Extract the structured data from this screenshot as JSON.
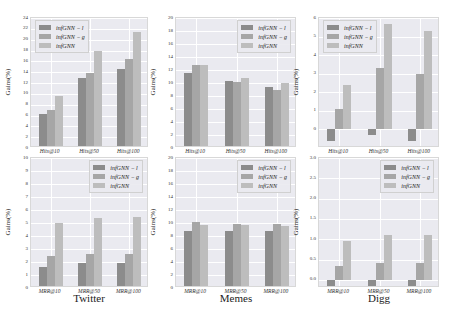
{
  "colors": {
    "infGNN-l": "#8c8c8c",
    "infGNN-g": "#a6a6a6",
    "infGNN": "#bdbdbd",
    "plot_bg": "#eaeaf0",
    "grid": "#ffffff"
  },
  "legend": [
    "infGNN − l",
    "infGNN − g",
    "infGNN"
  ],
  "datasets": [
    "Twitter",
    "Memes",
    "Digg"
  ],
  "chart_data": [
    {
      "type": "bar",
      "dataset": "Twitter",
      "metric": "Hits",
      "categories": [
        "Hits@10",
        "Hits@50",
        "Hits@100"
      ],
      "series": [
        {
          "name": "infGNN − l",
          "values": [
            6.2,
            12.9,
            14.5
          ]
        },
        {
          "name": "infGNN − g",
          "values": [
            7.0,
            13.8,
            16.5
          ]
        },
        {
          "name": "infGNN",
          "values": [
            9.6,
            17.9,
            21.4
          ]
        }
      ],
      "ylabel": "Gains(%)",
      "ylim": [
        0,
        24
      ],
      "yticks": [
        0,
        2,
        4,
        6,
        8,
        10,
        12,
        14,
        16,
        18,
        20,
        22,
        24
      ],
      "legend_position": "upper left",
      "grid": true
    },
    {
      "type": "bar",
      "dataset": "Memes",
      "metric": "Hits",
      "categories": [
        "Hits@10",
        "Hits@50",
        "Hits@100"
      ],
      "series": [
        {
          "name": "infGNN − l",
          "values": [
            11.5,
            10.3,
            9.4
          ]
        },
        {
          "name": "infGNN − g",
          "values": [
            12.8,
            10.1,
            9.0
          ]
        },
        {
          "name": "infGNN",
          "values": [
            12.8,
            10.8,
            10.0
          ]
        }
      ],
      "ylabel": "Gains(%)",
      "ylim": [
        0,
        20
      ],
      "yticks": [
        0,
        2,
        4,
        6,
        8,
        10,
        12,
        14,
        16,
        18,
        20
      ],
      "legend_position": "upper right",
      "grid": true
    },
    {
      "type": "bar",
      "dataset": "Digg",
      "metric": "Hits",
      "categories": [
        "Hits@10",
        "Hits@50",
        "Hits@100"
      ],
      "series": [
        {
          "name": "infGNN − l",
          "values": [
            -0.6,
            -0.3,
            -0.6
          ]
        },
        {
          "name": "infGNN − g",
          "values": [
            1.1,
            3.3,
            3.0
          ]
        },
        {
          "name": "infGNN",
          "values": [
            2.4,
            5.7,
            5.3
          ]
        }
      ],
      "ylabel": "Gains(%)",
      "ylim": [
        -1.0,
        6
      ],
      "yticks": [
        0,
        1,
        2,
        3,
        4,
        5,
        6
      ],
      "legend_position": "upper left",
      "grid": true
    },
    {
      "type": "bar",
      "dataset": "Twitter",
      "metric": "MRR",
      "categories": [
        "MRR@10",
        "MRR@50",
        "MRR@100"
      ],
      "series": [
        {
          "name": "infGNN − l",
          "values": [
            1.65,
            1.95,
            1.95
          ]
        },
        {
          "name": "infGNN − g",
          "values": [
            2.45,
            2.65,
            2.65
          ]
        },
        {
          "name": "infGNN",
          "values": [
            5.0,
            5.4,
            5.45
          ]
        }
      ],
      "ylabel": "Gains(%)",
      "ylim": [
        0,
        10
      ],
      "yticks": [
        0,
        1,
        2,
        3,
        4,
        5,
        6,
        7,
        8,
        9,
        10
      ],
      "legend_position": "upper right",
      "grid": true
    },
    {
      "type": "bar",
      "dataset": "Memes",
      "metric": "MRR",
      "categories": [
        "MRR@10",
        "MRR@50",
        "MRR@100"
      ],
      "series": [
        {
          "name": "infGNN − l",
          "values": [
            8.8,
            8.7,
            8.7
          ]
        },
        {
          "name": "infGNN − g",
          "values": [
            10.1,
            9.9,
            9.9
          ]
        },
        {
          "name": "infGNN",
          "values": [
            9.7,
            9.7,
            9.6
          ]
        }
      ],
      "ylabel": "Gains(%)",
      "ylim": [
        0,
        20
      ],
      "yticks": [
        0,
        2,
        4,
        6,
        8,
        10,
        12,
        14,
        16,
        18,
        20
      ],
      "legend_position": "upper right",
      "grid": true
    },
    {
      "type": "bar",
      "dataset": "Digg",
      "metric": "MRR",
      "categories": [
        "MRR@10",
        "MRR@50",
        "MRR@100"
      ],
      "series": [
        {
          "name": "infGNN − l",
          "values": [
            -0.15,
            -0.15,
            -0.15
          ]
        },
        {
          "name": "infGNN − g",
          "values": [
            0.35,
            0.42,
            0.42
          ]
        },
        {
          "name": "infGNN",
          "values": [
            0.95,
            1.1,
            1.1
          ]
        }
      ],
      "ylabel": "Gains(%)",
      "ylim": [
        -0.2,
        3.0
      ],
      "yticks": [
        0.0,
        0.5,
        1.0,
        1.5,
        2.0,
        2.5,
        3.0
      ],
      "legend_position": "upper right",
      "grid": true
    }
  ]
}
